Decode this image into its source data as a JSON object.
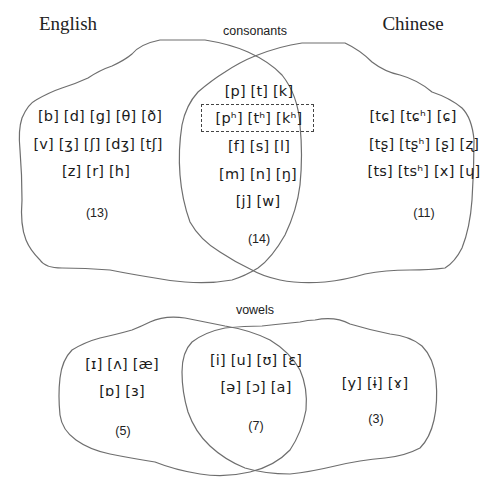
{
  "languages": {
    "left": "English",
    "right": "Chinese"
  },
  "consonants": {
    "title": "consonants",
    "english_only": {
      "rows": [
        "[b] [d] [g] [θ] [ð]",
        "[v] [ʒ] [ʃ] [dʒ] [tʃ]",
        "[z] [r] [h]"
      ],
      "count": "(13)"
    },
    "shared": {
      "rows": [
        "[p] [t] [k]",
        "[pʰ] [tʰ] [kʰ]",
        "[f] [s] [l]",
        "[m] [n] [ŋ]",
        "[j] [w]"
      ],
      "highlighted_row_index": 1,
      "count": "(14)"
    },
    "chinese_only": {
      "rows": [
        "[tɕ] [tɕʰ] [ɕ]",
        "[tʂ] [tʂʰ] [ʂ] [ʐ]",
        "[ts] [tsʰ] [x] [ɥ]"
      ],
      "count": "(11)"
    }
  },
  "vowels": {
    "title": "vowels",
    "english_only": {
      "rows": [
        "[ɪ] [ʌ] [æ]",
        "[ɒ] [ɜ]"
      ],
      "count": "(5)"
    },
    "shared": {
      "rows": [
        "[i] [u] [ʊ] [ɛ]",
        "[ə] [ɔ] [a]"
      ],
      "count": "(7)"
    },
    "chinese_only": {
      "rows": [
        "[y] [ɨ] [ɤ]"
      ],
      "count": "(3)"
    }
  },
  "colors": {
    "outline": "#6e6e6e",
    "text": "#1a1a1a",
    "dashed_box": "#444444",
    "background": "#ffffff"
  }
}
